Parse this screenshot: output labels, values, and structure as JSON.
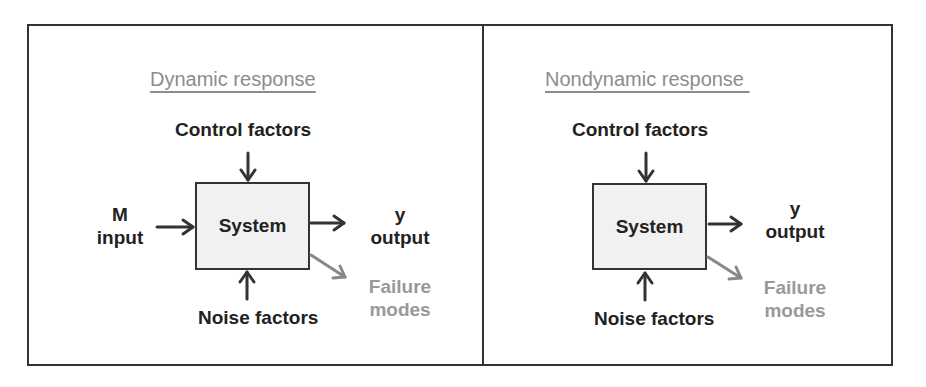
{
  "diagram": {
    "left_panel": {
      "title": "Dynamic response",
      "control_label": "Control factors",
      "input_label_line1": "M",
      "input_label_line2": "input",
      "system_label": "System",
      "output_label_line1": "y",
      "output_label_line2": "output",
      "failure_label_line1": "Failure",
      "failure_label_line2": "modes",
      "noise_label": "Noise factors"
    },
    "right_panel": {
      "title": "Nondynamic response ",
      "control_label": "Control factors",
      "system_label": "System",
      "output_label_line1": "y",
      "output_label_line2": "output",
      "failure_label_line1": "Failure",
      "failure_label_line2": "modes",
      "noise_label": "Noise factors"
    },
    "colors": {
      "stroke": "#333333",
      "title": "#8c8c8c",
      "failure": "#8e8e8e",
      "box_fill": "#f1f1f1"
    }
  }
}
